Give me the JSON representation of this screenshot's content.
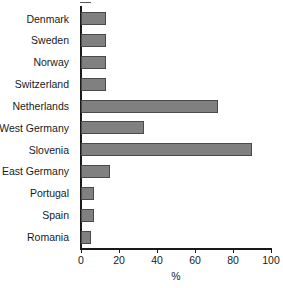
{
  "chart_data": {
    "type": "bar",
    "orientation": "horizontal",
    "title": "",
    "subtitle": "",
    "xlabel": "%",
    "ylabel": "",
    "categories": [
      "Denmark",
      "Sweden",
      "Norway",
      "Switzerland",
      "Netherlands",
      "West Germany",
      "Slovenia",
      "East Germany",
      "Portugal",
      "Spain",
      "Romania"
    ],
    "values": [
      13,
      13,
      13,
      13,
      72,
      33,
      90,
      15,
      7,
      7,
      5
    ],
    "xlim": [
      0,
      100
    ],
    "xticks": [
      0,
      20,
      40,
      60,
      80,
      100
    ],
    "xtick_labels": [
      "0",
      "20",
      "40",
      "60",
      "80",
      "100"
    ],
    "grid": false,
    "legend": false,
    "legend_position": "none",
    "bar_color": "#808080",
    "bar_border_color": "#4a4a4a",
    "axis_color": "#1a1a1a",
    "background_color": "#ffffff"
  }
}
